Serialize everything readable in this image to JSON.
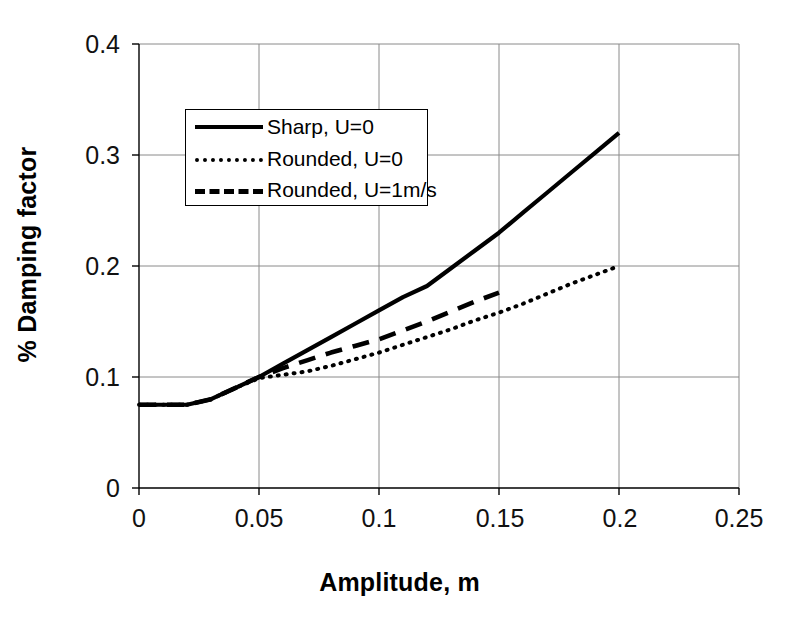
{
  "chart_data": {
    "type": "line",
    "title": "",
    "xlabel": "Amplitude, m",
    "ylabel": "% Damping factor",
    "xlim": [
      0,
      0.25
    ],
    "ylim": [
      0,
      0.4
    ],
    "xticks": [
      "0",
      "0.05",
      "0.1",
      "0.15",
      "0.2",
      "0.25"
    ],
    "xtick_values": [
      0,
      0.05,
      0.1,
      0.15,
      0.2,
      0.25
    ],
    "yticks": [
      "0",
      "0.1",
      "0.2",
      "0.3",
      "0.4"
    ],
    "ytick_values": [
      0,
      0.1,
      0.2,
      0.3,
      0.4
    ],
    "grid": true,
    "legend_position": "upper-left-inside",
    "series": [
      {
        "name": "Sharp, U=0",
        "style": "solid",
        "color": "#000000",
        "x": [
          0,
          0.01,
          0.02,
          0.03,
          0.04,
          0.05,
          0.06,
          0.07,
          0.08,
          0.09,
          0.1,
          0.11,
          0.12,
          0.13,
          0.14,
          0.15,
          0.16,
          0.17,
          0.18,
          0.19,
          0.2
        ],
        "y": [
          0.075,
          0.075,
          0.075,
          0.08,
          0.09,
          0.1,
          0.112,
          0.124,
          0.136,
          0.148,
          0.16,
          0.172,
          0.182,
          0.198,
          0.214,
          0.23,
          0.248,
          0.266,
          0.284,
          0.302,
          0.32
        ]
      },
      {
        "name": "Rounded, U=0",
        "style": "dotted",
        "color": "#000000",
        "x": [
          0,
          0.01,
          0.02,
          0.03,
          0.04,
          0.05,
          0.06,
          0.07,
          0.08,
          0.09,
          0.1,
          0.11,
          0.12,
          0.13,
          0.14,
          0.15,
          0.16,
          0.17,
          0.18,
          0.19,
          0.2
        ],
        "y": [
          0.075,
          0.075,
          0.075,
          0.08,
          0.09,
          0.099,
          0.102,
          0.105,
          0.11,
          0.116,
          0.122,
          0.129,
          0.136,
          0.143,
          0.151,
          0.158,
          0.166,
          0.175,
          0.184,
          0.192,
          0.2
        ]
      },
      {
        "name": "Rounded, U=1m/s",
        "style": "dashed",
        "color": "#000000",
        "x": [
          0,
          0.01,
          0.02,
          0.03,
          0.04,
          0.05,
          0.06,
          0.07,
          0.08,
          0.09,
          0.1,
          0.11,
          0.12,
          0.13,
          0.14,
          0.15
        ],
        "y": [
          0.075,
          0.075,
          0.075,
          0.08,
          0.09,
          0.1,
          0.108,
          0.115,
          0.122,
          0.128,
          0.134,
          0.142,
          0.15,
          0.159,
          0.168,
          0.176
        ]
      }
    ]
  },
  "legend": {
    "items": [
      {
        "label": "Sharp, U=0",
        "style": "solid"
      },
      {
        "label": "Rounded, U=0",
        "style": "dotted"
      },
      {
        "label": "Rounded, U=1m/s",
        "style": "dashed"
      }
    ]
  }
}
